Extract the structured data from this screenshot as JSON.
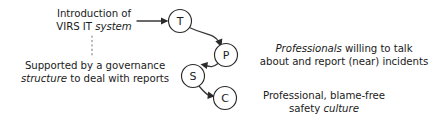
{
  "diagram": {
    "background_color": "#ffffff",
    "text_color": "#1b1b1b",
    "edge_color": "#3a3a3a",
    "node_stroke_color": "#2a2a2a",
    "dotted_link_color": "#8a8a8a",
    "nodes": [
      {
        "id": "T",
        "label": "T",
        "cx": 180,
        "cy": 21,
        "r": 11.5
      },
      {
        "id": "P",
        "label": "P",
        "cx": 226,
        "cy": 55,
        "r": 11.5
      },
      {
        "id": "S",
        "label": "S",
        "cx": 193,
        "cy": 76,
        "r": 11.5
      },
      {
        "id": "C",
        "label": "C",
        "cx": 225,
        "cy": 98,
        "r": 11.5
      }
    ],
    "edges": [
      {
        "from": "input",
        "to": "T",
        "style": "straight-arrow"
      },
      {
        "from": "T",
        "to": "P",
        "style": "curved-arrow"
      },
      {
        "from": "P",
        "to": "S",
        "style": "curved-arrow"
      },
      {
        "from": "S",
        "to": "C",
        "style": "curved-arrow"
      }
    ],
    "dotted_link": {
      "from": "intro-label",
      "to": "support-label",
      "x": 92,
      "y1": 36,
      "y2": 58
    },
    "labels": {
      "intro": {
        "line1": "Introduction of",
        "line2_plain": "VIRS IT ",
        "line2_italic": "system"
      },
      "support": {
        "line1": "Supported by a governance",
        "line2_italic": "structure",
        "line2_plain": " to deal with reports"
      },
      "professionals": {
        "line1_italic": "Professionals",
        "line1_plain": " willing to talk",
        "line2": "about and report (near) incidents"
      },
      "culture": {
        "line1": "Professional, blame-free",
        "line2_plain": "safety ",
        "line2_italic": "culture"
      }
    }
  }
}
